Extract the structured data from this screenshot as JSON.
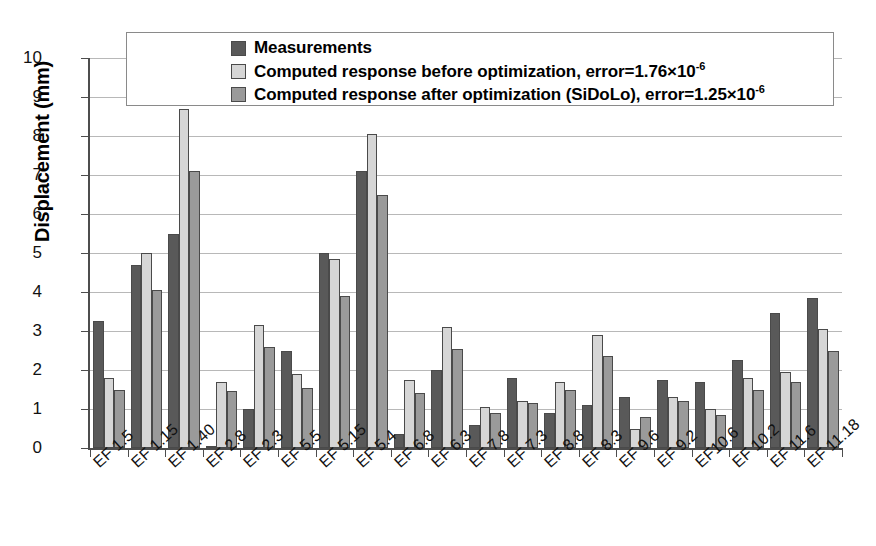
{
  "chart_data": {
    "type": "bar",
    "title": "",
    "xlabel": "",
    "ylabel": "Displacement (mm)",
    "ylim": [
      0,
      10
    ],
    "ytick_labels": [
      "10",
      "9",
      "8",
      "7",
      "6",
      "5",
      "4",
      "3",
      "2",
      "1",
      "0"
    ],
    "yticks": [
      10,
      9,
      8,
      7,
      6,
      5,
      4,
      3,
      2,
      1,
      0
    ],
    "grid": true,
    "legend_position": "top-center",
    "categories": [
      "EF 1.5",
      "EF 1.15",
      "EF 1.40",
      "EF 2.8",
      "EF 2.3",
      "EF 5.5",
      "EF 5.15",
      "EF 5.4",
      "EF 6.8",
      "EF 6.3",
      "EF 7.8",
      "EF 7.3",
      "EF 8.8",
      "EF 8.3",
      "EF 9.6",
      "EF 9.2",
      "EF10.6",
      "EF 10.2",
      "EF 11.6",
      "EF 11.18"
    ],
    "series": [
      {
        "name": "Measurements",
        "color": "#595959",
        "values": [
          3.25,
          4.7,
          5.5,
          0.05,
          1.0,
          2.5,
          5.0,
          7.1,
          0.35,
          2.0,
          0.6,
          1.8,
          0.9,
          1.1,
          1.3,
          1.75,
          1.7,
          2.25,
          3.45,
          3.85
        ]
      },
      {
        "name": "Computed response before optimization, error=1.76×10⁻⁶",
        "color": "#d6d6d6",
        "values": [
          1.8,
          5.0,
          8.7,
          1.7,
          3.15,
          1.9,
          4.85,
          8.05,
          1.75,
          3.1,
          1.05,
          1.2,
          1.7,
          2.9,
          0.5,
          1.3,
          1.0,
          1.8,
          1.95,
          3.05
        ]
      },
      {
        "name": "Computed response after optimization (SiDoLo), error=1.25×10⁻⁶",
        "color": "#9a9a9a",
        "values": [
          1.48,
          4.05,
          7.1,
          1.45,
          2.6,
          1.55,
          3.9,
          6.5,
          1.4,
          2.55,
          0.9,
          1.15,
          1.5,
          2.35,
          0.8,
          1.2,
          0.85,
          1.5,
          1.7,
          2.5
        ]
      }
    ]
  },
  "legend": {
    "entries": [
      {
        "label": "Measurements",
        "error_value": "",
        "exponent": ""
      },
      {
        "label": "Computed response before optimization, error=1.76×10",
        "error_value": "",
        "exponent": "-6"
      },
      {
        "label": "Computed response after optimization (SiDoLo), error=1.25×10",
        "error_value": "",
        "exponent": "-6"
      }
    ]
  }
}
